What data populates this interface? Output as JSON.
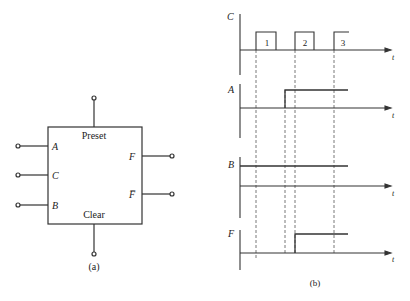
{
  "block": {
    "top_label": "Preset",
    "bottom_label": "Clear",
    "inputs": [
      "A",
      "C",
      "B"
    ],
    "outputs": [
      "F",
      "F̅"
    ],
    "caption": "(a)"
  },
  "timing": {
    "caption": "(b)",
    "time_label": "t",
    "signals": [
      {
        "name": "C",
        "pulse_labels": [
          "1",
          "2",
          "3"
        ]
      },
      {
        "name": "A"
      },
      {
        "name": "B"
      },
      {
        "name": "F"
      }
    ]
  },
  "colors": {
    "line": "#333333",
    "dash": "#555555"
  }
}
